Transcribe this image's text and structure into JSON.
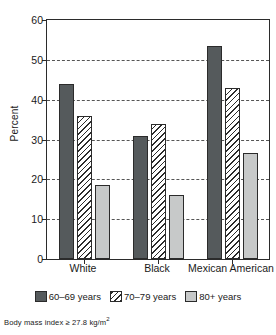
{
  "chart_data": {
    "type": "bar",
    "title": "",
    "subtitle": "",
    "xlabel": "",
    "ylabel": "Percent",
    "categories": [
      "White",
      "Black",
      "Mexican American"
    ],
    "series": [
      {
        "name": "60–69 years",
        "values": [
          44.0,
          31.0,
          53.5
        ],
        "color": "#555a5c",
        "fill": "solid"
      },
      {
        "name": "70–79 years",
        "values": [
          36.0,
          34.0,
          43.0
        ],
        "color": "#ffffff",
        "fill": "diagonal-hatch"
      },
      {
        "name": "80+ years",
        "values": [
          18.5,
          16.0,
          26.5
        ],
        "color": "#c7c9c9",
        "fill": "solid"
      }
    ],
    "ylim": [
      0,
      60
    ],
    "yticks": [
      0,
      10,
      20,
      30,
      40,
      50,
      60
    ],
    "ytick_labels": [
      "0",
      "10",
      "20",
      "30",
      "40",
      "50",
      "60"
    ],
    "gridlines": [
      10,
      20,
      30,
      40,
      50
    ],
    "grid": "horizontal-dashed",
    "legend_position": "below",
    "annotation": "Body mass index ≥ 27.8 kg/m",
    "annotation_exponent": "2"
  },
  "axis": {
    "y_title": "Percent"
  },
  "legend": {
    "items": [
      {
        "label": "60–69 years"
      },
      {
        "label": "70–79 years"
      },
      {
        "label": "80+ years"
      }
    ]
  },
  "footnote": {
    "text": "Body mass index ≥ 27.8 kg/m",
    "exponent": "2"
  }
}
